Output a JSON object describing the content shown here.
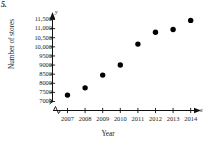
{
  "problem": {
    "number": "5."
  },
  "axis_names": {
    "y": "y",
    "x": "x"
  },
  "labels": {
    "ylabel": "Number of stores",
    "xlabel": "Year"
  },
  "chart_data": {
    "type": "scatter",
    "title": "",
    "xlabel": "Year",
    "ylabel": "Number of stores",
    "x": [
      2007,
      2008,
      2009,
      2010,
      2011,
      2012,
      2013,
      2014
    ],
    "categories": [
      "2007",
      "2008",
      "2009",
      "2010",
      "2011",
      "2012",
      "2013",
      "2014"
    ],
    "values": [
      7350,
      7750,
      8450,
      9000,
      10150,
      10800,
      10950,
      11450
    ],
    "series": [
      {
        "name": "Number of stores",
        "values": [
          7350,
          7750,
          8450,
          9000,
          10150,
          10800,
          10950,
          11450
        ]
      }
    ],
    "xlim": [
      2006.4,
      2014.8
    ],
    "ylim": [
      7000,
      11750
    ],
    "ytick_labels": [
      "11,500",
      "11,000",
      "10,500",
      "10,000",
      "9500",
      "9000",
      "8500",
      "8000",
      "7500",
      "7000"
    ],
    "ytick_values": [
      11500,
      11000,
      10500,
      10000,
      9500,
      9000,
      8500,
      8000,
      7500,
      7000
    ],
    "xtick_labels": [
      "2007",
      "2008",
      "2009",
      "2010",
      "2011",
      "2012",
      "2013",
      "2014"
    ],
    "grid": false,
    "legend": "none",
    "axis_break_x": true,
    "axis_break_y": true,
    "marker": "filled-circle",
    "marker_color": "#000000"
  }
}
